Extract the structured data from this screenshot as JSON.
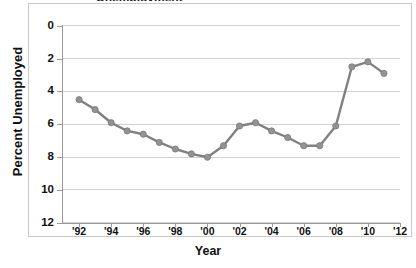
{
  "figure": {
    "title_clipped": "Unemployment",
    "border_color": "#c9c9c9",
    "background": "#ffffff"
  },
  "axes": {
    "y_label": "Percent Unemployed",
    "x_label": "Year",
    "y_ticks": [
      "12",
      "10",
      "8",
      "6",
      "4",
      "2",
      "0"
    ],
    "x_ticks": [
      "'92",
      "'94",
      "'96",
      "'98",
      "'00",
      "'02",
      "'04",
      "'06",
      "'08",
      "'10",
      "'12"
    ]
  },
  "style": {
    "line_color": "#808080",
    "marker_color": "#939393",
    "marker_edge": "#7a7a7a",
    "grid_color": "#d2d2d2",
    "axis_color": "#9a9a9a"
  },
  "chart_data": {
    "type": "line",
    "title": "Unemployment",
    "xlabel": "Year",
    "ylabel": "Percent Unemployed",
    "xlim": [
      1991,
      2012
    ],
    "ylim": [
      0,
      12
    ],
    "grid": true,
    "legend": "none",
    "markers": true,
    "x": [
      1992,
      1993,
      1994,
      1995,
      1996,
      1997,
      1998,
      1999,
      2000,
      2001,
      2002,
      2003,
      2004,
      2005,
      2006,
      2007,
      2008,
      2009,
      2010,
      2011
    ],
    "x_tick_labels": [
      "'92",
      "'94",
      "'96",
      "'98",
      "'00",
      "'02",
      "'04",
      "'06",
      "'08",
      "'10",
      "'12"
    ],
    "x_tick_values": [
      1992,
      1994,
      1996,
      1998,
      2000,
      2002,
      2004,
      2006,
      2008,
      2010,
      2012
    ],
    "y_tick_values": [
      0,
      2,
      4,
      6,
      8,
      10,
      12
    ],
    "series": [
      {
        "name": "Percent Unemployed",
        "color": "#808080",
        "values": [
          7.5,
          6.9,
          6.1,
          5.6,
          5.4,
          4.9,
          4.5,
          4.2,
          4.0,
          4.7,
          5.9,
          6.1,
          5.6,
          5.2,
          4.7,
          4.7,
          5.9,
          9.5,
          9.8,
          9.1
        ]
      }
    ]
  }
}
